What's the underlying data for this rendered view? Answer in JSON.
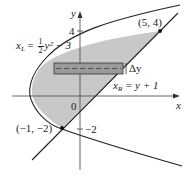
{
  "figure": {
    "type": "region-between-curves",
    "colors": {
      "shade": "#c8c8c8",
      "curve": "#222222",
      "axis": "#555555",
      "strip": "#9a9a9a"
    },
    "axes": {
      "x_label": "x",
      "y_label": "y",
      "origin_label": "0",
      "y_tick_top": "4",
      "y_tick_bottom": "−2"
    },
    "curves": {
      "left": {
        "name": "x_L",
        "label_var": "x",
        "label_sub": "L",
        "label_eq": "=",
        "frac_num": "1",
        "frac_den": "2",
        "label_rest": "y² − 3"
      },
      "right": {
        "name": "x_R",
        "label_var": "x",
        "label_sub": "R",
        "label_rest": "= y + 1"
      }
    },
    "points": [
      {
        "label": "(5, 4)",
        "x": 5,
        "y": 4
      },
      {
        "label": "(−1, −2)",
        "x": -1,
        "y": -2
      }
    ],
    "strip_label": "Δy"
  }
}
